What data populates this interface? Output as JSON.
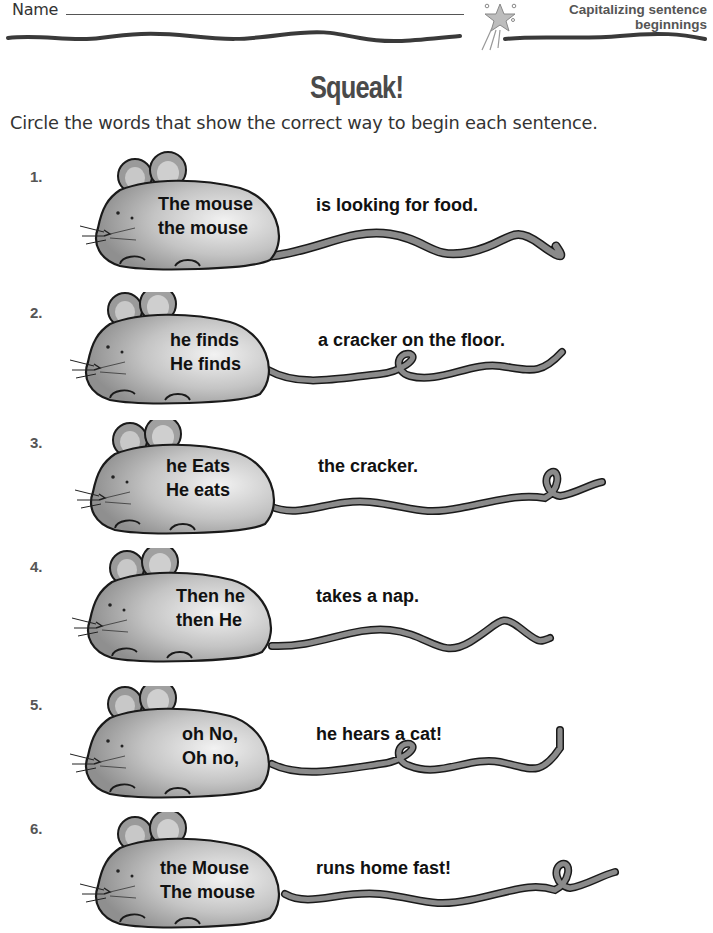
{
  "header": {
    "name_label": "Name",
    "topic_line1": "Capitalizing sentence",
    "topic_line2": "beginnings"
  },
  "title": "Squeak!",
  "instruction": "Circle the words that show the correct way to begin each sentence.",
  "items": [
    {
      "number": "1.",
      "choices": [
        "The mouse",
        "the mouse"
      ],
      "ending": "is looking for food.",
      "tail": "wavy"
    },
    {
      "number": "2.",
      "choices": [
        "he finds",
        "He finds"
      ],
      "ending": "a cracker on the floor.",
      "tail": "loop"
    },
    {
      "number": "3.",
      "choices": [
        "he Eats",
        "He eats"
      ],
      "ending": "the cracker.",
      "tail": "loop-end"
    },
    {
      "number": "4.",
      "choices": [
        "Then he",
        "then He"
      ],
      "ending": "takes a nap.",
      "tail": "wavy"
    },
    {
      "number": "5.",
      "choices": [
        "oh No,",
        "Oh no,"
      ],
      "ending": "he hears a cat!",
      "tail": "loop"
    },
    {
      "number": "6.",
      "choices": [
        "the Mouse",
        "The mouse"
      ],
      "ending": "runs home fast!",
      "tail": "loop-end"
    }
  ],
  "colors": {
    "mouse_fill": "#a9a9a9",
    "mouse_highlight": "#efefef",
    "outline": "#1a1a1a",
    "tail": "#8a8a8a",
    "header_text": "#555555"
  }
}
